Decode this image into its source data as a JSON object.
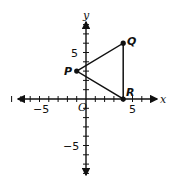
{
  "diagram": {
    "type": "coordinate-plane",
    "axes": {
      "x_label": "x",
      "y_label": "y",
      "origin_label": "O",
      "x_range": [
        -8,
        7
      ],
      "y_range": [
        -8,
        8
      ],
      "tick_labels": {
        "x_neg": "−5",
        "x_pos": "5",
        "y_pos": "5",
        "y_neg": "−5"
      }
    },
    "points": [
      {
        "label": "P",
        "x": -1,
        "y": 3
      },
      {
        "label": "Q",
        "x": 4,
        "y": 6
      },
      {
        "label": "R",
        "x": 4,
        "y": 0
      }
    ],
    "segments": [
      [
        "P",
        "Q"
      ],
      [
        "Q",
        "R"
      ],
      [
        "R",
        "P"
      ]
    ],
    "colors": {
      "stroke": "#111111",
      "background": "#ffffff"
    }
  }
}
